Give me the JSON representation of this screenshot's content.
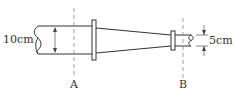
{
  "diagram": {
    "title": "",
    "labels": {
      "large_diameter": "10cm",
      "small_diameter": "5cm",
      "section_a": "A",
      "section_b": "B"
    },
    "colors": {
      "stroke": "#333333",
      "dash": "#888888",
      "background": "#ffffff"
    }
  }
}
